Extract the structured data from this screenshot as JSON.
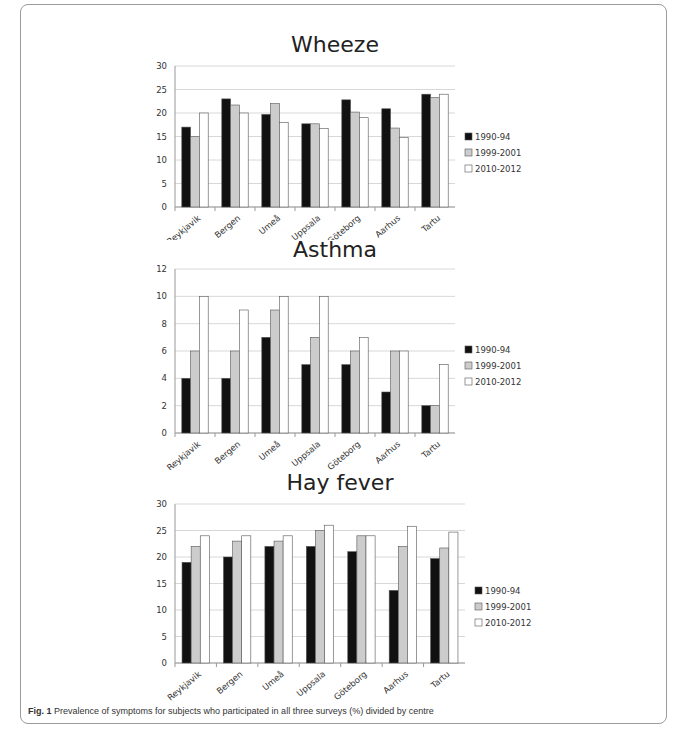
{
  "caption": {
    "label": "Fig. 1",
    "text": " Prevalence of symptoms for subjects who participated in all three surveys (%) divided by centre"
  },
  "legend": [
    {
      "name": "1990-94",
      "color": "#111111"
    },
    {
      "name": "1999-2001",
      "color": "#cccccc"
    },
    {
      "name": "2010-2012",
      "color": "#ffffff"
    }
  ],
  "chart_data": [
    {
      "type": "bar",
      "title": "Wheeze",
      "categories": [
        "Reykjavik",
        "Bergen",
        "Umeå",
        "Uppsala",
        "Göteborg",
        "Aarhus",
        "Tartu"
      ],
      "series": [
        {
          "name": "1990-94",
          "values": [
            17,
            23,
            19.7,
            17.7,
            22.8,
            20.9,
            24
          ]
        },
        {
          "name": "1999-2001",
          "values": [
            15,
            21.7,
            22,
            17.7,
            20.2,
            16.8,
            23.3
          ]
        },
        {
          "name": "2010-2012",
          "values": [
            20,
            20,
            18,
            16.7,
            19,
            14.8,
            24
          ]
        }
      ],
      "ylim": [
        0,
        30
      ],
      "yticks": [
        0,
        5,
        10,
        15,
        20,
        25,
        30
      ],
      "xlabel": "",
      "ylabel": "",
      "grid": true,
      "legend_position": "right"
    },
    {
      "type": "bar",
      "title": "Asthma",
      "categories": [
        "Reykjavik",
        "Bergen",
        "Umeå",
        "Uppsala",
        "Göteborg",
        "Aarhus",
        "Tartu"
      ],
      "series": [
        {
          "name": "1990-94",
          "values": [
            4,
            4,
            7,
            5,
            5,
            3,
            2
          ]
        },
        {
          "name": "1999-2001",
          "values": [
            6,
            6,
            9,
            7,
            6,
            6,
            2
          ]
        },
        {
          "name": "2010-2012",
          "values": [
            10,
            9,
            10,
            10,
            7,
            6,
            5
          ]
        }
      ],
      "ylim": [
        0,
        12
      ],
      "yticks": [
        0,
        2,
        4,
        6,
        8,
        10,
        12
      ],
      "xlabel": "",
      "ylabel": "",
      "grid": true,
      "legend_position": "right"
    },
    {
      "type": "bar",
      "title": "Hay fever",
      "categories": [
        "Reykjavik",
        "Bergen",
        "Umeå",
        "Uppsala",
        "Göteborg",
        "Aarhus",
        "Tartu"
      ],
      "series": [
        {
          "name": "1990-94",
          "values": [
            19,
            20,
            22,
            22,
            21,
            13.7,
            19.7
          ]
        },
        {
          "name": "1999-2001",
          "values": [
            22,
            23,
            23,
            25,
            24,
            22,
            21.7
          ]
        },
        {
          "name": "2010-2012",
          "values": [
            24,
            24,
            24,
            26,
            24,
            25.8,
            24.7
          ]
        }
      ],
      "ylim": [
        0,
        30
      ],
      "yticks": [
        0,
        5,
        10,
        15,
        20,
        25,
        30
      ],
      "xlabel": "",
      "ylabel": "",
      "grid": true,
      "legend_position": "right"
    }
  ]
}
